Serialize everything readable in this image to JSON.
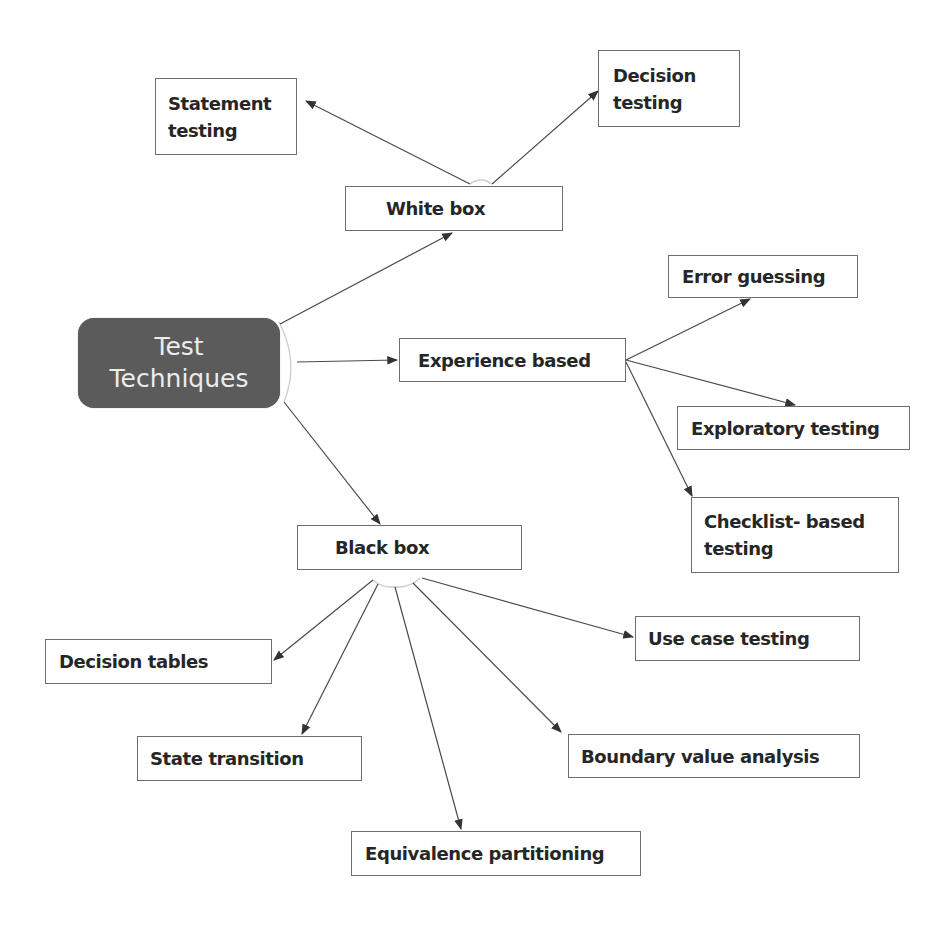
{
  "diagram": {
    "type": "mind-map",
    "root": {
      "line1": "Test",
      "line2": "Techniques"
    },
    "branches": {
      "white_box": {
        "label": "White box",
        "children": {
          "statement": {
            "line1": "Statement",
            "line2": "testing"
          },
          "decision": {
            "line1": "Decision",
            "line2": "testing"
          }
        }
      },
      "experience": {
        "label": "Experience based",
        "children": {
          "error_guessing": {
            "label": "Error guessing"
          },
          "exploratory": {
            "label": "Exploratory testing"
          },
          "checklist": {
            "line1": "Checklist- based",
            "line2": "testing"
          }
        }
      },
      "black_box": {
        "label": "Black box",
        "children": {
          "decision_tables": {
            "label": "Decision tables"
          },
          "state_transition": {
            "label": "State transition"
          },
          "equivalence": {
            "label": "Equivalence partitioning"
          },
          "boundary": {
            "label": "Boundary value analysis"
          },
          "use_case": {
            "label": "Use case testing"
          }
        }
      }
    },
    "colors": {
      "root_fill": "#5b5b5b",
      "root_text": "#ececec",
      "node_border": "#6e6e6e",
      "node_text": "#262626",
      "connector": "#4a4a4a"
    }
  }
}
